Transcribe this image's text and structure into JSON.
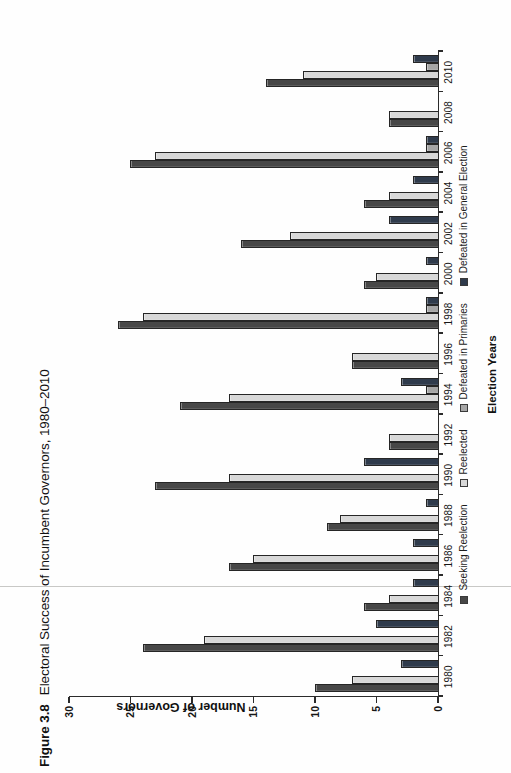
{
  "title": {
    "figure_label": "Figure 3.8",
    "text": "Electoral Success of Incumbent Governors, 1980–2010"
  },
  "chart_data": {
    "type": "bar",
    "xlabel": "Election Years",
    "ylabel": "Number of Governors",
    "ylim": [
      0,
      30
    ],
    "ytick_interval": 5,
    "yticks": [
      0,
      5,
      10,
      15,
      20,
      25,
      30
    ],
    "grid": false,
    "legend_position": "bottom",
    "categories": [
      "1980",
      "1982",
      "1984",
      "1986",
      "1988",
      "1990",
      "1992",
      "1994",
      "1996",
      "1998",
      "2000",
      "2002",
      "2004",
      "2006",
      "2008",
      "2010"
    ],
    "series": [
      {
        "name": "Seeking Reelection",
        "color": "#474747",
        "values": [
          10,
          24,
          6,
          17,
          9,
          23,
          4,
          21,
          7,
          26,
          6,
          16,
          6,
          25,
          4,
          14
        ]
      },
      {
        "name": "Reelected",
        "color": "#d8d8d8",
        "values": [
          7,
          19,
          4,
          15,
          8,
          17,
          4,
          17,
          7,
          24,
          5,
          12,
          4,
          23,
          4,
          11
        ]
      },
      {
        "name": "Defeated in Primaries",
        "color": "#a6a6a6",
        "values": [
          0,
          0,
          0,
          0,
          0,
          0,
          0,
          1,
          0,
          1,
          0,
          0,
          0,
          1,
          0,
          1
        ]
      },
      {
        "name": "Defeated in General Election",
        "color": "#2f3b4c",
        "values": [
          3,
          5,
          2,
          2,
          1,
          6,
          0,
          3,
          0,
          1,
          1,
          4,
          2,
          1,
          0,
          2
        ]
      }
    ],
    "px_per_unit": 12.3
  },
  "artifact": {
    "scan_line_color": "#c8c8c6"
  }
}
